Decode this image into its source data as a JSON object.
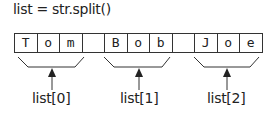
{
  "code": "list = str.split()",
  "cells": [
    "T",
    "o",
    "m",
    "",
    "B",
    "o",
    "b",
    "",
    "J",
    "o",
    "e"
  ],
  "labels": [
    "list[0]",
    "list[1]",
    "list[2]"
  ]
}
